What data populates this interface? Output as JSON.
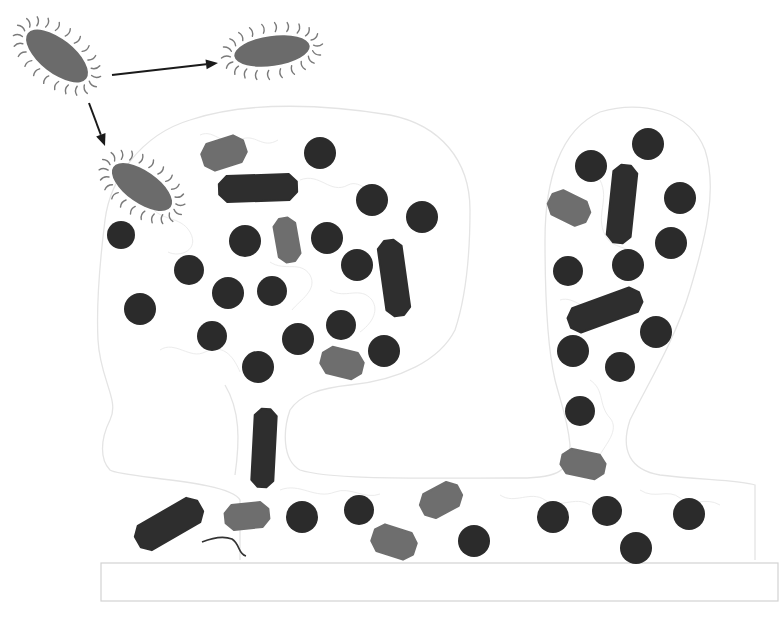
{
  "diagram": {
    "colors": {
      "background": "#ffffff",
      "planktonic_cell": "#6b6b6b",
      "flagella": "#7a7a7a",
      "coccus": "#2b2b2b",
      "rod_dark": "#2e2e2e",
      "rod_light": "#6e6e6e",
      "outline": "#e4e4e4",
      "arrow": "#1a1a1a"
    },
    "planktonic_cells": [
      {
        "id": "motile-cell-origin",
        "cx": 57,
        "cy": 56,
        "rx": 37,
        "ry": 17,
        "angle": 38
      },
      {
        "id": "motile-cell-swimming",
        "cx": 272,
        "cy": 51,
        "rx": 38,
        "ry": 15,
        "angle": -8
      },
      {
        "id": "motile-cell-attaching",
        "cx": 142,
        "cy": 187,
        "rx": 35,
        "ry": 16,
        "angle": 35
      }
    ],
    "arrows": [
      {
        "id": "arrow-to-swimming",
        "x1": 112,
        "y1": 75,
        "x2": 218,
        "y2": 63
      },
      {
        "id": "arrow-to-attachment",
        "x1": 89,
        "y1": 103,
        "x2": 105,
        "y2": 146
      }
    ],
    "cocci": [
      {
        "cx": 320,
        "cy": 153,
        "r": 16
      },
      {
        "cx": 372,
        "cy": 200,
        "r": 16
      },
      {
        "cx": 422,
        "cy": 217,
        "r": 16
      },
      {
        "cx": 121,
        "cy": 235,
        "r": 14
      },
      {
        "cx": 245,
        "cy": 241,
        "r": 16
      },
      {
        "cx": 327,
        "cy": 238,
        "r": 16
      },
      {
        "cx": 357,
        "cy": 265,
        "r": 16
      },
      {
        "cx": 189,
        "cy": 270,
        "r": 15
      },
      {
        "cx": 228,
        "cy": 293,
        "r": 16
      },
      {
        "cx": 272,
        "cy": 291,
        "r": 15
      },
      {
        "cx": 140,
        "cy": 309,
        "r": 16
      },
      {
        "cx": 212,
        "cy": 336,
        "r": 15
      },
      {
        "cx": 298,
        "cy": 339,
        "r": 16
      },
      {
        "cx": 341,
        "cy": 325,
        "r": 15
      },
      {
        "cx": 258,
        "cy": 367,
        "r": 16
      },
      {
        "cx": 384,
        "cy": 351,
        "r": 16
      },
      {
        "cx": 648,
        "cy": 144,
        "r": 16
      },
      {
        "cx": 591,
        "cy": 166,
        "r": 16
      },
      {
        "cx": 680,
        "cy": 198,
        "r": 16
      },
      {
        "cx": 671,
        "cy": 243,
        "r": 16
      },
      {
        "cx": 568,
        "cy": 271,
        "r": 15
      },
      {
        "cx": 628,
        "cy": 265,
        "r": 16
      },
      {
        "cx": 656,
        "cy": 332,
        "r": 16
      },
      {
        "cx": 573,
        "cy": 351,
        "r": 16
      },
      {
        "cx": 620,
        "cy": 367,
        "r": 15
      },
      {
        "cx": 580,
        "cy": 411,
        "r": 15
      },
      {
        "cx": 302,
        "cy": 517,
        "r": 16
      },
      {
        "cx": 359,
        "cy": 510,
        "r": 15
      },
      {
        "cx": 474,
        "cy": 541,
        "r": 16
      },
      {
        "cx": 553,
        "cy": 517,
        "r": 16
      },
      {
        "cx": 607,
        "cy": 511,
        "r": 15
      },
      {
        "cx": 636,
        "cy": 548,
        "r": 16
      },
      {
        "cx": 689,
        "cy": 514,
        "r": 16
      }
    ],
    "rods": [
      {
        "shade": "dark",
        "cx": 258,
        "cy": 188,
        "len": 78,
        "w": 26,
        "angle": -2
      },
      {
        "shade": "light",
        "cx": 224,
        "cy": 153,
        "len": 44,
        "w": 28,
        "angle": -18
      },
      {
        "shade": "light",
        "cx": 287,
        "cy": 240,
        "len": 44,
        "w": 22,
        "angle": 80
      },
      {
        "shade": "dark",
        "cx": 394,
        "cy": 278,
        "len": 76,
        "w": 24,
        "angle": 82
      },
      {
        "shade": "light",
        "cx": 342,
        "cy": 363,
        "len": 42,
        "w": 27,
        "angle": 14
      },
      {
        "shade": "dark",
        "cx": 264,
        "cy": 448,
        "len": 78,
        "w": 22,
        "angle": 93
      },
      {
        "shade": "dark",
        "cx": 169,
        "cy": 524,
        "len": 72,
        "w": 28,
        "angle": -30
      },
      {
        "shade": "light",
        "cx": 247,
        "cy": 516,
        "len": 44,
        "w": 25,
        "angle": -6
      },
      {
        "shade": "light",
        "cx": 441,
        "cy": 500,
        "len": 42,
        "w": 27,
        "angle": -28
      },
      {
        "shade": "light",
        "cx": 394,
        "cy": 542,
        "len": 44,
        "w": 28,
        "angle": 18
      },
      {
        "shade": "dark",
        "cx": 622,
        "cy": 204,
        "len": 78,
        "w": 24,
        "angle": 96
      },
      {
        "shade": "light",
        "cx": 569,
        "cy": 208,
        "len": 42,
        "w": 27,
        "angle": 26
      },
      {
        "shade": "dark",
        "cx": 605,
        "cy": 310,
        "len": 76,
        "w": 26,
        "angle": -20
      },
      {
        "shade": "light",
        "cx": 583,
        "cy": 464,
        "len": 44,
        "w": 25,
        "angle": 12
      }
    ],
    "substrate": {
      "x": 101,
      "y": 563,
      "w": 677,
      "h": 38
    },
    "fiber": "M202,542 C212,538 224,536 232,539 C240,544 238,554 246,556"
  }
}
